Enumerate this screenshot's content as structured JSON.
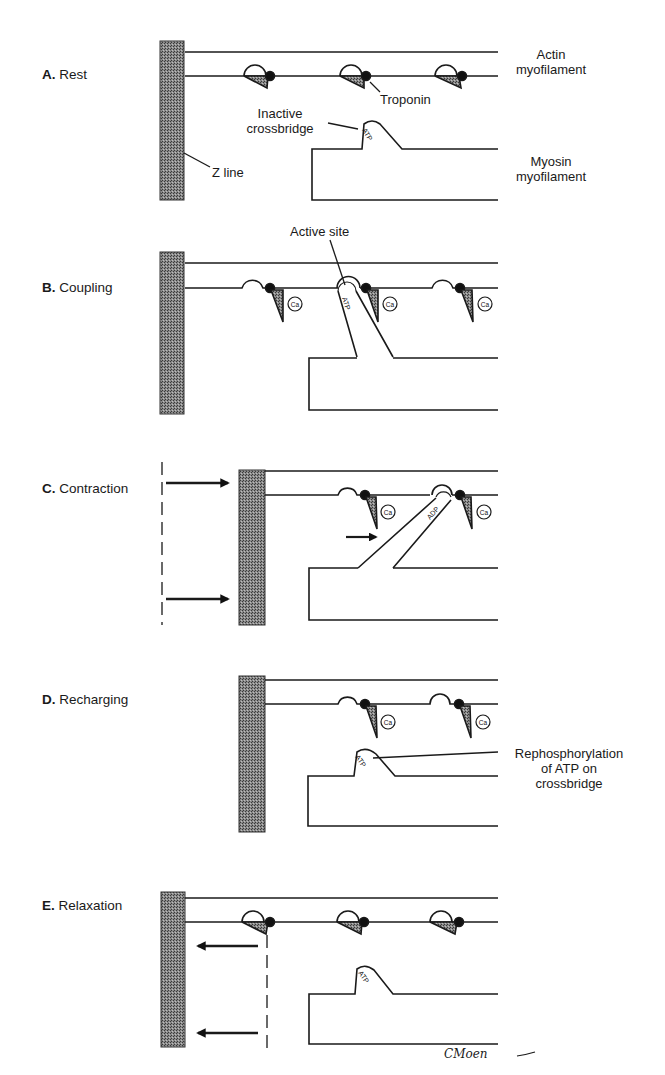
{
  "figure": {
    "signature": "CMoen",
    "colors": {
      "line": "#1a1a1a",
      "zline_fill": "#6e6e6e",
      "troponin_fill": "#7a7a7a",
      "background": "#ffffff"
    }
  },
  "stages": [
    {
      "letter": "A.",
      "name": "Rest"
    },
    {
      "letter": "B.",
      "name": "Coupling"
    },
    {
      "letter": "C.",
      "name": "Contraction"
    },
    {
      "letter": "D.",
      "name": "Recharging"
    },
    {
      "letter": "E.",
      "name": "Relaxation"
    }
  ],
  "labels": {
    "actin_line1": "Actin",
    "actin_line2": "myofilament",
    "troponin": "Troponin",
    "inactive_line1": "Inactive",
    "inactive_line2": "crossbridge",
    "zline": "Z line",
    "myosin_line1": "Myosin",
    "myosin_line2": "myofilament",
    "active_site": "Active site",
    "rephos_line1": "Rephosphorylation",
    "rephos_line2": "of ATP on",
    "rephos_line3": "crossbridge"
  },
  "molecules": {
    "atp": "ATP",
    "adp": "ADP",
    "ca": "Ca"
  }
}
